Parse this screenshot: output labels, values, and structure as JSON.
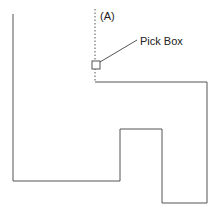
{
  "diagram": {
    "label_a": "(A)",
    "pick_box_label": "Pick Box",
    "colors": {
      "line": "#555555",
      "text": "#222222",
      "background": "#ffffff"
    },
    "outline_points": [
      [
        13,
        14
      ],
      [
        13,
        181
      ],
      [
        120,
        181
      ],
      [
        120,
        129
      ],
      [
        162,
        129
      ],
      [
        162,
        203
      ],
      [
        207,
        203
      ],
      [
        207,
        82
      ],
      [
        95,
        82
      ]
    ],
    "dotted_line": {
      "x": 95,
      "y1": 9,
      "y2": 82
    },
    "pick_box": {
      "x": 92,
      "y": 61,
      "size": 8
    },
    "leader_line": {
      "x1": 100,
      "y1": 62,
      "x2": 137,
      "y2": 40
    }
  }
}
